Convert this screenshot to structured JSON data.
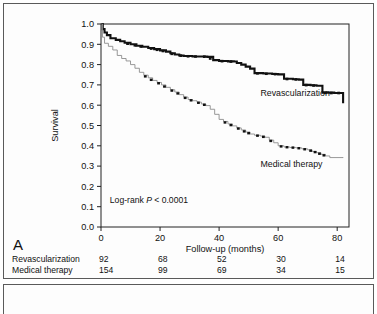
{
  "figure": {
    "panel_letter": "A"
  },
  "chart_data": {
    "type": "line",
    "title": "",
    "xlabel": "Follow-up (months)",
    "ylabel": "Survival",
    "xlim": [
      0,
      84
    ],
    "ylim": [
      0,
      1
    ],
    "xticks": [
      0,
      20,
      40,
      60,
      80
    ],
    "xtick_labels": [
      "0",
      "20",
      "40",
      "60",
      "80"
    ],
    "yticks": [
      0.0,
      0.1,
      0.2,
      0.3,
      0.4,
      0.5,
      0.6,
      0.7,
      0.8,
      0.9,
      1.0
    ],
    "ytick_labels": [
      "0.0",
      "0.1",
      "0.2",
      "0.3",
      "0.4",
      "0.5",
      "0.6",
      "0.7",
      "0.8",
      "0.9",
      "1.0"
    ],
    "grid": false,
    "legend_position": "inline-curve-labels",
    "annotation": {
      "prefix": "Log-rank ",
      "italic": "P",
      "suffix": " < 0.0001",
      "x": 3,
      "y": 0.12
    },
    "series": [
      {
        "name": "Revascularization",
        "style": "thick-black-step",
        "color": "#111111",
        "label_x": 54,
        "label_y": 0.645,
        "points": [
          [
            0,
            1.0
          ],
          [
            0.6,
            0.975
          ],
          [
            1.2,
            0.958
          ],
          [
            2.0,
            0.945
          ],
          [
            3.2,
            0.93
          ],
          [
            5.0,
            0.922
          ],
          [
            6.5,
            0.915
          ],
          [
            8.0,
            0.908
          ],
          [
            10.0,
            0.9
          ],
          [
            12.0,
            0.893
          ],
          [
            14.0,
            0.888
          ],
          [
            16.0,
            0.882
          ],
          [
            18.0,
            0.876
          ],
          [
            20.0,
            0.87
          ],
          [
            22.0,
            0.864
          ],
          [
            23.5,
            0.856
          ],
          [
            25.0,
            0.85
          ],
          [
            26.5,
            0.845
          ],
          [
            28.0,
            0.842
          ],
          [
            31.0,
            0.84
          ],
          [
            34.0,
            0.84
          ],
          [
            36.0,
            0.838
          ],
          [
            38.0,
            0.822
          ],
          [
            40.0,
            0.818
          ],
          [
            43.0,
            0.816
          ],
          [
            45.0,
            0.815
          ],
          [
            46.0,
            0.808
          ],
          [
            47.5,
            0.8
          ],
          [
            49.0,
            0.79
          ],
          [
            50.5,
            0.78
          ],
          [
            52.0,
            0.758
          ],
          [
            55.0,
            0.756
          ],
          [
            58.0,
            0.754
          ],
          [
            60.0,
            0.752
          ],
          [
            62.0,
            0.73
          ],
          [
            65.0,
            0.728
          ],
          [
            67.0,
            0.726
          ],
          [
            68.5,
            0.7
          ],
          [
            71.0,
            0.698
          ],
          [
            73.0,
            0.696
          ],
          [
            75.0,
            0.662
          ],
          [
            79.0,
            0.66
          ],
          [
            81.5,
            0.66
          ],
          [
            82.0,
            0.61
          ]
        ],
        "censor_marks": [
          [
            9,
            0.903
          ],
          [
            11.5,
            0.895
          ],
          [
            13.5,
            0.889
          ],
          [
            17,
            0.879
          ],
          [
            19,
            0.873
          ],
          [
            21,
            0.867
          ],
          [
            24,
            0.853
          ],
          [
            27,
            0.844
          ],
          [
            29.5,
            0.841
          ],
          [
            32,
            0.84
          ],
          [
            35,
            0.839
          ],
          [
            37,
            0.83
          ],
          [
            41,
            0.817
          ],
          [
            44,
            0.815
          ],
          [
            53,
            0.757
          ],
          [
            56,
            0.755
          ],
          [
            59,
            0.753
          ],
          [
            63,
            0.729
          ],
          [
            66,
            0.727
          ],
          [
            69.5,
            0.699
          ],
          [
            72,
            0.697
          ],
          [
            76,
            0.661
          ],
          [
            78,
            0.66
          ],
          [
            80.5,
            0.66
          ]
        ]
      },
      {
        "name": "Medical therapy",
        "style": "thin-gray-step-with-censors",
        "color": "#8d8d8d",
        "label_x": 54,
        "label_y": 0.295,
        "points": [
          [
            0,
            1.0
          ],
          [
            0.5,
            0.935
          ],
          [
            1.2,
            0.905
          ],
          [
            2.5,
            0.89
          ],
          [
            4.0,
            0.872
          ],
          [
            5.5,
            0.845
          ],
          [
            7.0,
            0.83
          ],
          [
            8.5,
            0.818
          ],
          [
            10.0,
            0.8
          ],
          [
            11.5,
            0.782
          ],
          [
            13.0,
            0.762
          ],
          [
            14.5,
            0.748
          ],
          [
            16.0,
            0.735
          ],
          [
            17.5,
            0.722
          ],
          [
            19.0,
            0.712
          ],
          [
            20.5,
            0.7
          ],
          [
            22.0,
            0.688
          ],
          [
            23.5,
            0.676
          ],
          [
            25.0,
            0.665
          ],
          [
            26.5,
            0.652
          ],
          [
            28.0,
            0.64
          ],
          [
            29.5,
            0.628
          ],
          [
            31.0,
            0.622
          ],
          [
            32.5,
            0.615
          ],
          [
            34.0,
            0.606
          ],
          [
            35.5,
            0.598
          ],
          [
            37.0,
            0.58
          ],
          [
            38.5,
            0.555
          ],
          [
            40.0,
            0.53
          ],
          [
            41.5,
            0.52
          ],
          [
            43.0,
            0.508
          ],
          [
            44.5,
            0.498
          ],
          [
            46.0,
            0.488
          ],
          [
            47.5,
            0.478
          ],
          [
            49.0,
            0.468
          ],
          [
            50.5,
            0.458
          ],
          [
            52.0,
            0.452
          ],
          [
            54.0,
            0.448
          ],
          [
            55.5,
            0.442
          ],
          [
            57.0,
            0.428
          ],
          [
            58.5,
            0.415
          ],
          [
            60.0,
            0.4
          ],
          [
            62.0,
            0.394
          ],
          [
            64.0,
            0.392
          ],
          [
            66.0,
            0.39
          ],
          [
            68.0,
            0.385
          ],
          [
            70.0,
            0.38
          ],
          [
            71.5,
            0.372
          ],
          [
            73.0,
            0.366
          ],
          [
            74.5,
            0.358
          ],
          [
            76.0,
            0.35
          ],
          [
            77.5,
            0.342
          ],
          [
            82.0,
            0.34
          ]
        ],
        "censor_marks": [
          [
            15,
            0.742
          ],
          [
            17,
            0.725
          ],
          [
            19.5,
            0.708
          ],
          [
            21.5,
            0.692
          ],
          [
            24,
            0.672
          ],
          [
            26,
            0.658
          ],
          [
            28.5,
            0.636
          ],
          [
            30.5,
            0.624
          ],
          [
            33,
            0.612
          ],
          [
            35,
            0.602
          ],
          [
            42,
            0.515
          ],
          [
            44,
            0.502
          ],
          [
            46.5,
            0.485
          ],
          [
            48.5,
            0.471
          ],
          [
            50,
            0.462
          ],
          [
            53,
            0.45
          ],
          [
            55,
            0.444
          ],
          [
            57.5,
            0.424
          ],
          [
            61,
            0.397
          ],
          [
            63,
            0.393
          ],
          [
            65,
            0.391
          ],
          [
            67,
            0.388
          ],
          [
            69,
            0.383
          ],
          [
            71,
            0.376
          ],
          [
            72.5,
            0.369
          ],
          [
            74,
            0.361
          ],
          [
            75.5,
            0.353
          ]
        ]
      }
    ]
  },
  "risk_table": {
    "rows": [
      {
        "name": "Revascularization",
        "values": [
          "92",
          "68",
          "52",
          "30",
          "14"
        ]
      },
      {
        "name": "Medical therapy",
        "values": [
          "154",
          "99",
          "69",
          "34",
          "15"
        ]
      }
    ]
  }
}
